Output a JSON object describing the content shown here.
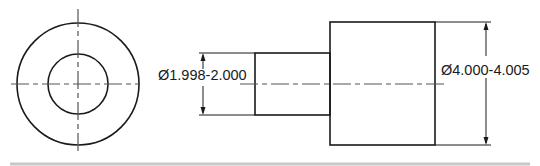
{
  "drawing": {
    "title": "Bushing / stepped shaft engineering drawing",
    "views": [
      "end-view",
      "side-view"
    ],
    "dimensions": [
      {
        "id": "small-diameter",
        "label": "Ø1.998-2.000",
        "feature": "small cylinder diameter"
      },
      {
        "id": "large-diameter",
        "label": "Ø4.000-4.005",
        "feature": "large cylinder diameter"
      }
    ],
    "colors": {
      "line": "#1a1a1a",
      "centerline": "#555555",
      "separator": "#c8c8c8"
    }
  }
}
